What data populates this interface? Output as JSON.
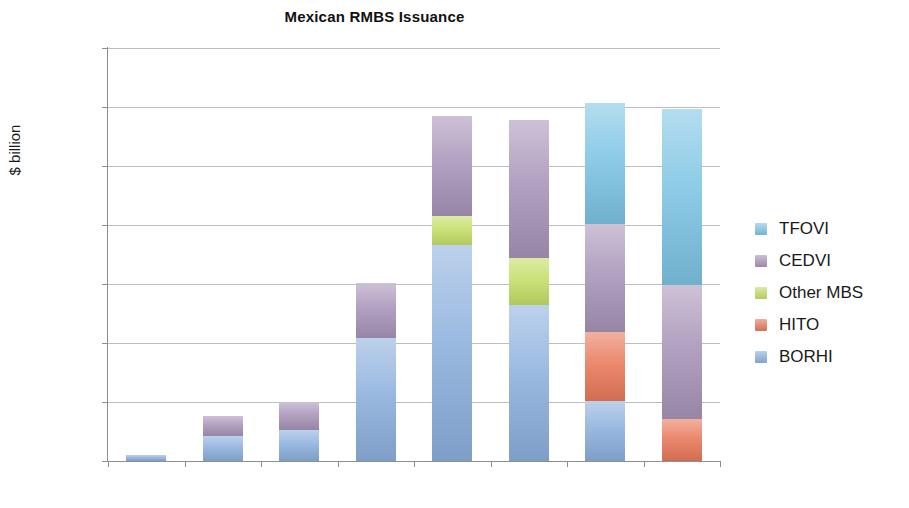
{
  "chart_data": {
    "type": "bar",
    "stacked": true,
    "title": "Mexican RMBS Issuance",
    "xlabel": "",
    "ylabel": "$ billion",
    "categories": [
      "2003",
      "2004",
      "2005",
      "2006",
      "2007",
      "2008",
      "2009",
      "2010"
    ],
    "ylim": [
      0,
      3500
    ],
    "yticks": [
      0,
      500,
      1000,
      1500,
      2000,
      2500,
      3000,
      3500
    ],
    "ytick_labels": [
      "0",
      "500",
      "1000",
      "1500",
      "2000",
      "2500",
      "3000",
      "3500"
    ],
    "grid": true,
    "legend_position": "right",
    "series": [
      {
        "name": "BORHI",
        "color": "#8cb0dd",
        "values": [
          50,
          215,
          260,
          1040,
          1830,
          1320,
          510,
          0
        ]
      },
      {
        "name": "HITO",
        "color": "#e8795a",
        "values": [
          0,
          0,
          0,
          0,
          0,
          0,
          580,
          360
        ]
      },
      {
        "name": "Other MBS",
        "color": "#c3de66",
        "values": [
          0,
          0,
          0,
          0,
          250,
          400,
          0,
          0
        ]
      },
      {
        "name": "CEDVI",
        "color": "#a894b8",
        "values": [
          0,
          170,
          240,
          470,
          840,
          1170,
          920,
          1130
        ]
      },
      {
        "name": "TFOVI",
        "color": "#7ec4e4",
        "values": [
          0,
          0,
          0,
          0,
          0,
          0,
          1020,
          1490
        ]
      }
    ],
    "totals": [
      50,
      385,
      500,
      1510,
      2920,
      2890,
      3030,
      2980
    ],
    "legend_entries": [
      {
        "label": "TFOVI",
        "color": "#7ec4e4"
      },
      {
        "label": "CEDVI",
        "color": "#a894b8"
      },
      {
        "label": "Other MBS",
        "color": "#c3de66"
      },
      {
        "label": "HITO",
        "color": "#e8795a"
      },
      {
        "label": "BORHI",
        "color": "#8cb0dd"
      }
    ],
    "stack_order_bottom_to_top": [
      "BORHI",
      "HITO",
      "Other MBS",
      "CEDVI",
      "TFOVI"
    ],
    "axis_color": "#8e8e8e",
    "grid_color": "#bdbdbd",
    "background": "#ffffff"
  }
}
